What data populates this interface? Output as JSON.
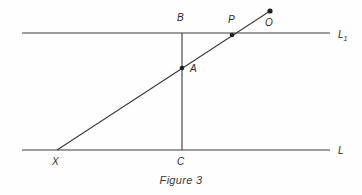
{
  "figure": {
    "caption": "Figure 3",
    "background_color": "#fefefe",
    "ink_color": "#3a3a3a",
    "label_color": "#2b2b2b"
  },
  "lines": {
    "upper": {
      "name": "L1",
      "label_main": "L",
      "label_sub": "1",
      "x_start": 22,
      "x_end": 330,
      "y": 33
    },
    "lower": {
      "name": "L",
      "label_main": "L",
      "label_sub": "",
      "x_start": 22,
      "x_end": 330,
      "y": 150
    },
    "vertical_segment": {
      "name": "BC",
      "x": 182,
      "y_top": 33,
      "y_bottom": 150
    },
    "diagonal_ray": {
      "name": "XO",
      "x_start": 57,
      "y_start": 150,
      "x_end": 270,
      "y_end": 11
    }
  },
  "points": [
    {
      "id": "B",
      "label": "B",
      "x": 182,
      "y": 33,
      "label_x": 177,
      "label_y": 13,
      "marker": false
    },
    {
      "id": "P",
      "label": "P",
      "x": 232,
      "y": 35,
      "label_x": 228,
      "label_y": 15,
      "marker": true
    },
    {
      "id": "O",
      "label": "O",
      "x": 270,
      "y": 11,
      "label_x": 265,
      "label_y": 18,
      "marker": true
    },
    {
      "id": "A",
      "label": "A",
      "x": 182,
      "y": 68,
      "label_x": 190,
      "label_y": 64,
      "marker": true
    },
    {
      "id": "X",
      "label": "X",
      "x": 57,
      "y": 150,
      "label_x": 52,
      "label_y": 157,
      "marker": false
    },
    {
      "id": "C",
      "label": "C",
      "x": 182,
      "y": 150,
      "label_x": 177,
      "label_y": 157,
      "marker": false
    }
  ],
  "line_labels": [
    {
      "for": "L1",
      "text": "L",
      "sub": "1",
      "x": 338,
      "y": 30
    },
    {
      "for": "L",
      "text": "L",
      "sub": "",
      "x": 338,
      "y": 146
    }
  ]
}
